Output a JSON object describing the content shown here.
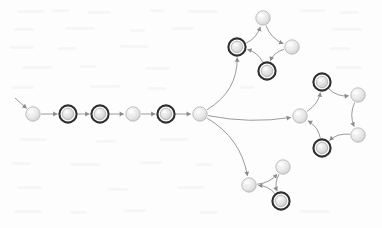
{
  "figure": {
    "kind": "directed-state-graph",
    "width": 382,
    "height": 228,
    "background_color": "#fdfdfd"
  },
  "style": {
    "node_fill_light": "#ececec",
    "node_fill_shade": "#d6d6d6",
    "node_stroke": "#a8a8ab",
    "accepting_ring_color": "#2e2e2e",
    "edge_color": "#8e8e91",
    "node_radius": 7.2,
    "accepting_ring_radius": 8.6
  },
  "legend": {
    "plain_state_name": "state",
    "accepting_state_name": "accepting-state",
    "start_marker_name": "start-arrow"
  },
  "nodes": [
    {
      "id": "q0",
      "label": "q0",
      "cx": 33,
      "cy": 114,
      "accepting": false,
      "group": "spine"
    },
    {
      "id": "q1",
      "label": "q1",
      "cx": 68,
      "cy": 114,
      "accepting": true,
      "group": "spine"
    },
    {
      "id": "q2",
      "label": "q2",
      "cx": 100,
      "cy": 114,
      "accepting": true,
      "group": "spine"
    },
    {
      "id": "q3",
      "label": "q3",
      "cx": 133,
      "cy": 114,
      "accepting": false,
      "group": "spine"
    },
    {
      "id": "q4",
      "label": "q4",
      "cx": 166,
      "cy": 114,
      "accepting": true,
      "group": "spine"
    },
    {
      "id": "hub",
      "label": "hub",
      "cx": 200,
      "cy": 114,
      "accepting": false,
      "group": "hub"
    },
    {
      "id": "t0",
      "label": "t0",
      "cx": 237,
      "cy": 47,
      "accepting": true,
      "group": "top-cycle"
    },
    {
      "id": "t1",
      "label": "t1",
      "cx": 263,
      "cy": 18,
      "accepting": false,
      "group": "top-cycle"
    },
    {
      "id": "t2",
      "label": "t2",
      "cx": 292,
      "cy": 47,
      "accepting": false,
      "group": "top-cycle"
    },
    {
      "id": "t3",
      "label": "t3",
      "cx": 267,
      "cy": 71,
      "accepting": true,
      "group": "top-cycle"
    },
    {
      "id": "r0",
      "label": "r0",
      "cx": 300,
      "cy": 116,
      "accepting": false,
      "group": "right-cycle"
    },
    {
      "id": "r1",
      "label": "r1",
      "cx": 322,
      "cy": 82,
      "accepting": true,
      "group": "right-cycle"
    },
    {
      "id": "r2",
      "label": "r2",
      "cx": 358,
      "cy": 95,
      "accepting": false,
      "group": "right-cycle"
    },
    {
      "id": "r3",
      "label": "r3",
      "cx": 358,
      "cy": 135,
      "accepting": false,
      "group": "right-cycle"
    },
    {
      "id": "r4",
      "label": "r4",
      "cx": 322,
      "cy": 148,
      "accepting": true,
      "group": "right-cycle"
    },
    {
      "id": "b0",
      "label": "b0",
      "cx": 249,
      "cy": 185,
      "accepting": false,
      "group": "bottom-cycle"
    },
    {
      "id": "b1",
      "label": "b1",
      "cx": 283,
      "cy": 167,
      "accepting": false,
      "group": "bottom-cycle"
    },
    {
      "id": "b2",
      "label": "b2",
      "cx": 281,
      "cy": 201,
      "accepting": true,
      "group": "bottom-cycle"
    }
  ],
  "start_marker": {
    "from_x": 15,
    "from_y": 98,
    "to_node": "q0"
  },
  "edges": [
    {
      "from": "q0",
      "to": "q1",
      "curve": 0
    },
    {
      "from": "q1",
      "to": "q2",
      "curve": 0
    },
    {
      "from": "q2",
      "to": "q3",
      "curve": 0
    },
    {
      "from": "q3",
      "to": "q4",
      "curve": 0
    },
    {
      "from": "q4",
      "to": "hub",
      "curve": 0
    },
    {
      "from": "hub",
      "to": "t0",
      "curve": 22
    },
    {
      "from": "hub",
      "to": "r0",
      "curve": 9
    },
    {
      "from": "hub",
      "to": "b0",
      "curve": -20
    },
    {
      "from": "t0",
      "to": "t1",
      "curve": 9
    },
    {
      "from": "t1",
      "to": "t2",
      "curve": 9
    },
    {
      "from": "t2",
      "to": "t3",
      "curve": 9
    },
    {
      "from": "t3",
      "to": "t0",
      "curve": 9
    },
    {
      "from": "r0",
      "to": "r1",
      "curve": 9
    },
    {
      "from": "r1",
      "to": "r2",
      "curve": 9
    },
    {
      "from": "r2",
      "to": "r3",
      "curve": 9
    },
    {
      "from": "r3",
      "to": "r4",
      "curve": 9
    },
    {
      "from": "r4",
      "to": "r0",
      "curve": 9
    },
    {
      "from": "b0",
      "to": "b1",
      "curve": 8
    },
    {
      "from": "b1",
      "to": "b2",
      "curve": 8
    },
    {
      "from": "b2",
      "to": "b0",
      "curve": 8
    }
  ]
}
